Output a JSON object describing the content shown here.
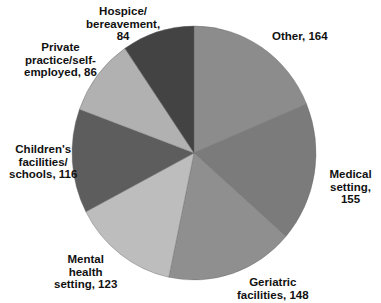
{
  "chart_data": {
    "type": "pie",
    "title": "",
    "start_angle_deg": 0,
    "direction": "clockwise",
    "total": 876,
    "slices": [
      {
        "label": "Other",
        "value": 164,
        "color": "#8c8c8c",
        "display": "Other, 164"
      },
      {
        "label": "Medical setting",
        "value": 155,
        "color": "#7b7b7b",
        "display": "Medical\nsetting, 155"
      },
      {
        "label": "Geriatric facilities",
        "value": 148,
        "color": "#8f8f8f",
        "display": "Geriatric\nfacilities, 148"
      },
      {
        "label": "Mental health setting",
        "value": 123,
        "color": "#bdbdbd",
        "display": "Mental\nhealth\nsetting, 123"
      },
      {
        "label": "Children's facilities/schools",
        "value": 116,
        "color": "#5d5d5d",
        "display": "Children's\nfacilities/\nschools, 116"
      },
      {
        "label": "Private practice/self-employed",
        "value": 86,
        "color": "#b1b1b1",
        "display": "Private\npractice/self-\nemployed, 86"
      },
      {
        "label": "Hospice/bereavement",
        "value": 84,
        "color": "#434343",
        "display": "Hospice/\nbereavement,\n84"
      }
    ],
    "legend": "none (direct labels)"
  }
}
